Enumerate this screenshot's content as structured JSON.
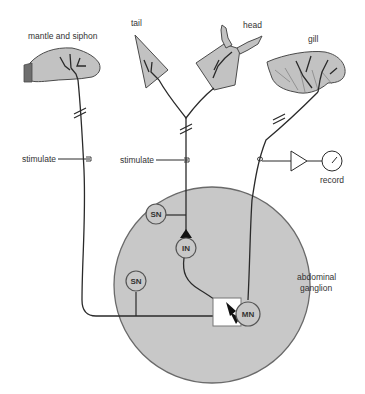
{
  "diagram": {
    "organs": {
      "mantle_siphon": "mantle and siphon",
      "tail": "tail",
      "head": "head",
      "gill": "gill"
    },
    "stimulate_left": "stimulate",
    "stimulate_middle": "stimulate",
    "record": "record",
    "ganglion_line1": "abdominal",
    "ganglion_line2": "ganglion",
    "neurons": {
      "sn_top": "SN",
      "interneuron": "IN",
      "sn_bottom": "SN",
      "motor": "MN"
    },
    "colors": {
      "ganglion_fill": "#c8c8c8",
      "organ_fill": "#c2c2c2",
      "line": "#2a2a2a",
      "synapse_box": "#ffffff"
    }
  }
}
